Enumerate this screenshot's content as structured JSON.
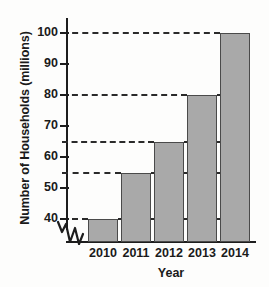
{
  "chart_data": {
    "type": "bar",
    "title": "",
    "xlabel": "Year",
    "ylabel": "Number of Households (millions)",
    "categories": [
      "2010",
      "2011",
      "2012",
      "2013",
      "2014"
    ],
    "values": [
      40,
      55,
      65,
      80,
      100
    ],
    "ylim": [
      35,
      105
    ],
    "y_ticks": [
      40,
      50,
      60,
      70,
      80,
      90,
      100
    ],
    "y_tick_labels": [
      "40",
      "50",
      "60",
      "70",
      "80",
      "90",
      "100"
    ],
    "gridlines": [
      40,
      55,
      65,
      80,
      100
    ],
    "grid": "dashed-horizontal-at-bar-tops",
    "legend": "none",
    "axis_break": true,
    "bar_fill_color": "#a9a9a9",
    "bar_edge_color": "#4a4a4a",
    "axis_color": "#1d1d1d",
    "background_color": "#fdfdfc"
  }
}
